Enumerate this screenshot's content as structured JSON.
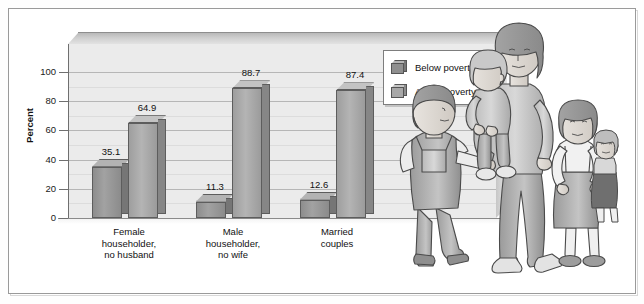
{
  "chart_data": {
    "type": "bar",
    "title": "",
    "xlabel": "",
    "ylabel": "Percent",
    "ylim": [
      0,
      100
    ],
    "yticks": [
      0,
      20,
      40,
      60,
      80,
      100
    ],
    "grid": true,
    "legend_position": "top-right",
    "categories": [
      "Female householder, no husband",
      "Male householder, no wife",
      "Married couples"
    ],
    "category_lines": [
      [
        "Female",
        "householder,",
        "no husband"
      ],
      [
        "Male",
        "householder,",
        "no wife"
      ],
      [
        "Married",
        "couples"
      ]
    ],
    "series": [
      {
        "name": "Below poverty",
        "values": [
          35.1,
          11.3,
          12.6
        ]
      },
      {
        "name": "Above poverty",
        "values": [
          64.9,
          88.7,
          87.4
        ]
      }
    ],
    "value_labels": [
      "35.1",
      "64.9",
      "11.3",
      "88.7",
      "12.6",
      "87.4"
    ]
  },
  "axis": {
    "y_label": "Percent",
    "y_ticks": [
      "100",
      "80",
      "60",
      "40",
      "20",
      "0"
    ]
  },
  "legend": {
    "items": [
      {
        "label": "Below poverty",
        "color": "#8f8f8f"
      },
      {
        "label": "Above poverty",
        "color": "#a8a8a8"
      }
    ]
  },
  "illustration": {
    "name": "family-illustration",
    "figures": [
      "boy-pointing",
      "mother-holding-toddler",
      "girl-with-doll"
    ]
  },
  "colors": {
    "wall": "#ebebeb",
    "gridline": "#b6b6b6",
    "bar_below": "#8f8f8f",
    "bar_above": "#a8a8a8",
    "frame": "#9a9a9a",
    "text": "#111111"
  }
}
